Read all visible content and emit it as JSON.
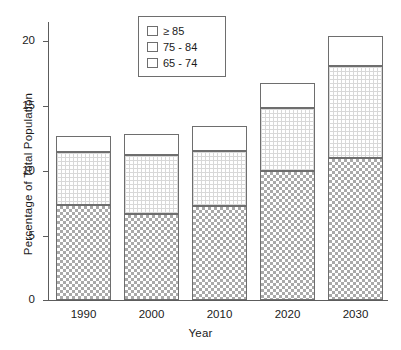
{
  "chart_data": {
    "type": "bar",
    "subtype": "stacked-bar",
    "title": "",
    "xlabel": "Year",
    "ylabel": "Percentage of Total Population",
    "categories": [
      "1990",
      "2000",
      "2010",
      "2020",
      "2030"
    ],
    "series": [
      {
        "name": "65 - 74",
        "values": [
          7.3,
          6.6,
          7.2,
          9.9,
          10.9
        ]
      },
      {
        "name": "75 - 84",
        "values": [
          4.1,
          4.6,
          4.3,
          4.9,
          7.1
        ]
      },
      {
        "name": "≥ 85",
        "values": [
          1.2,
          1.6,
          1.9,
          1.9,
          2.3
        ]
      }
    ],
    "cumulative_totals": [
      12.6,
      12.8,
      13.4,
      16.7,
      20.3
    ],
    "ylim": [
      0,
      21.4
    ],
    "yticks": [
      0,
      5,
      10,
      15,
      20
    ],
    "ytick_labels": [
      "0",
      "5",
      "10",
      "15",
      "20"
    ],
    "grid": false,
    "legend_position": "top-center"
  },
  "axes": {
    "y_title": "Percentage of Total Population",
    "x_title": "Year",
    "y_ticks": [
      {
        "label": "20",
        "value": 20
      },
      {
        "label": "15",
        "value": 15
      },
      {
        "label": "10",
        "value": 10
      },
      {
        "label": "5",
        "value": 5
      },
      {
        "label": "0",
        "value": 0
      }
    ],
    "x_ticks": [
      {
        "label": "1990"
      },
      {
        "label": "2000"
      },
      {
        "label": "2010"
      },
      {
        "label": "2020"
      },
      {
        "label": "2030"
      }
    ]
  },
  "legend": {
    "items": [
      {
        "label": "≥ 85",
        "pattern": "solid-white"
      },
      {
        "label": "75 - 84",
        "pattern": "fine-grid"
      },
      {
        "label": "65 - 74",
        "pattern": "checkerboard"
      }
    ]
  },
  "colors": {
    "axis": "#5c5c5c",
    "bar_outline": "#6e6e6e",
    "pattern_dark": "#a9a9a9",
    "pattern_light": "#d8d8d8",
    "background": "#ffffff",
    "text": "#1a1a1a"
  }
}
